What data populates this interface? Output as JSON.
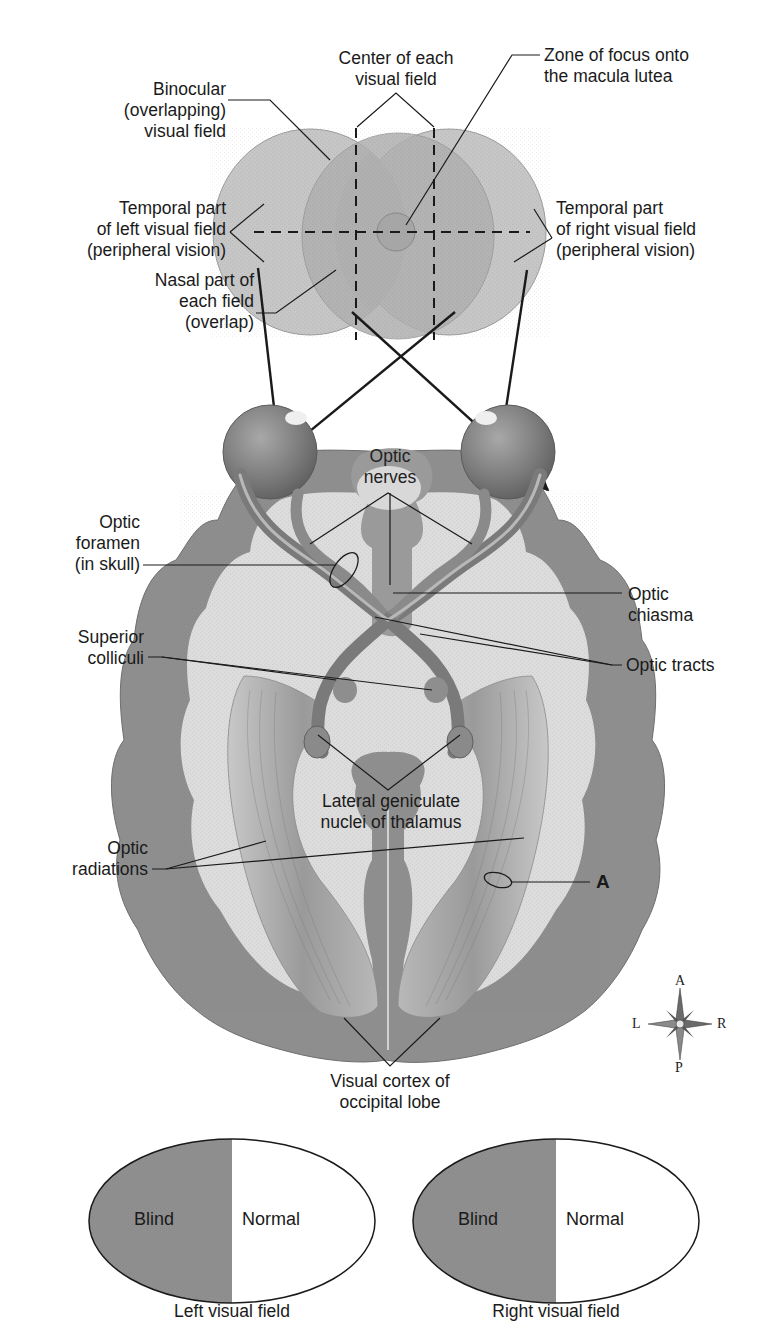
{
  "figure": {
    "colors": {
      "field_light": "#c9c9c9",
      "field_overlap": "#b3b3b3",
      "cortex_gray": "#8e8e8e",
      "white_matter": "#dcdcdc",
      "blind_fill": "#909090",
      "normal_fill": "#ffffff",
      "line": "#1a1a1a"
    }
  },
  "visual_field_labels": {
    "center_of_each_field": "Center of each\nvisual field",
    "binocular": "Binocular\n(overlapping)\nvisual field",
    "zone_of_focus": "Zone of focus onto\nthe macula lutea",
    "temporal_left": "Temporal part\nof left visual field\n(peripheral vision)",
    "temporal_right": "Temporal part\nof right visual field\n(peripheral vision)",
    "nasal_part": "Nasal part of\neach field\n(overlap)"
  },
  "brain_labels": {
    "optic_nerves": "Optic\nnerves",
    "optic_foramen": "Optic\nforamen\n(in skull)",
    "optic_chiasma": "Optic\nchiasma",
    "superior_colliculi": "Superior\ncolliculi",
    "optic_tracts": "Optic tracts",
    "lateral_geniculate": "Lateral geniculate\nnuclei of thalamus",
    "optic_radiations": "Optic\nradiations",
    "marker_a": "A",
    "visual_cortex": "Visual cortex of\noccipital lobe"
  },
  "compass": {
    "top": "A",
    "bottom": "P",
    "left": "L",
    "right": "R"
  },
  "field_results": [
    {
      "blind_label": "Blind",
      "normal_label": "Normal",
      "caption": "Left visual field"
    },
    {
      "blind_label": "Blind",
      "normal_label": "Normal",
      "caption": "Right visual field"
    }
  ]
}
